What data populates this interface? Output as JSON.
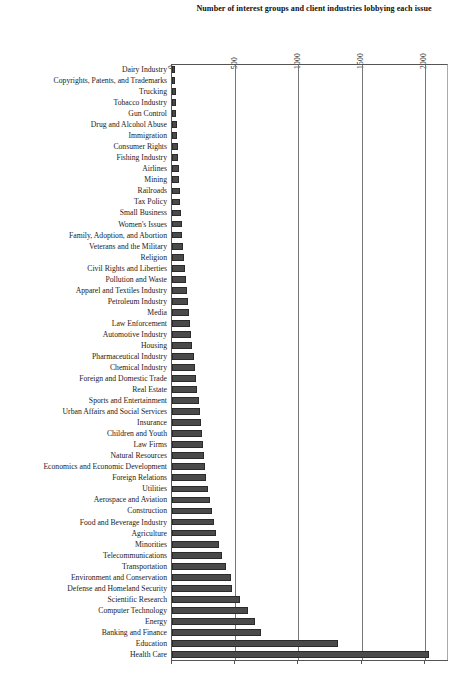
{
  "chart_data": {
    "type": "bar",
    "orientation": "horizontal",
    "title": "Number of interest groups and client industries lobbying each issue",
    "xlabel": "",
    "ylabel": "",
    "xlim": [
      0,
      2190
    ],
    "xticks": [
      0,
      500,
      1000,
      1500,
      2000
    ],
    "xtick_labels": [
      "0",
      "500",
      "1000",
      "1500",
      "2000"
    ],
    "grid": true,
    "legend": false,
    "bar_color": "#4a4a4a",
    "categories": [
      "Dairy Industry",
      "Copyrights, Patents, and Trademarks",
      "Trucking",
      "Tobacco Industry",
      "Gun Control",
      "Drug and Alcohol Abuse",
      "Immigration",
      "Consumer Rights",
      "Fishing Industry",
      "Airlines",
      "Mining",
      "Railroads",
      "Tax Policy",
      "Small Business",
      "Women's Issues",
      "Family, Adoption, and Abortion",
      "Veterans and the Military",
      "Religion",
      "Civil Rights and Liberties",
      "Pollution and Waste",
      "Apparel and Textiles Industry",
      "Petroleum Industry",
      "Media",
      "Law Enforcement",
      "Automotive Industry",
      "Housing",
      "Pharmaceutical Industry",
      "Chemical Industry",
      "Foreign and Domestic Trade",
      "Real Estate",
      "Sports and Entertainment",
      "Urban Affairs and Social Services",
      "Insurance",
      "Children and Youth",
      "Law Firms",
      "Natural Resources",
      "Economics and Economic Development",
      "Foreign Relations",
      "Utilities",
      "Aerospace and Aviation",
      "Construction",
      "Food and Beverage Industry",
      "Agriculture",
      "Minorities",
      "Telecommunications",
      "Transportation",
      "Environment and Conservation",
      "Defense and Homeland Security",
      "Scientific Research",
      "Computer Technology",
      "Energy",
      "Banking and Finance",
      "Education",
      "Health Care"
    ],
    "values": [
      20,
      24,
      28,
      30,
      33,
      36,
      40,
      44,
      48,
      52,
      56,
      60,
      64,
      70,
      76,
      82,
      88,
      95,
      102,
      110,
      118,
      126,
      134,
      142,
      150,
      160,
      172,
      182,
      192,
      200,
      210,
      218,
      226,
      234,
      242,
      252,
      262,
      272,
      286,
      300,
      316,
      332,
      348,
      368,
      392,
      430,
      466,
      474,
      540,
      600,
      660,
      700,
      1310,
      2035
    ]
  }
}
